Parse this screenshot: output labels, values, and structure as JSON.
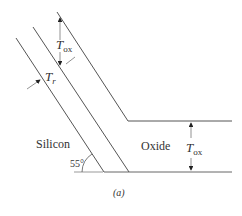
{
  "figure": {
    "caption": "(a)",
    "labels": {
      "silicon": "Silicon",
      "oxide": "Oxide",
      "angle": "55°",
      "tox_top_main": "T",
      "tox_top_sub": "ox",
      "tox_right_main": "T",
      "tox_right_sub": "ox",
      "tr_main": "T",
      "tr_sub": "r"
    },
    "angle_degrees": 55,
    "colors": {
      "line": "#555555",
      "arrow": "#222222",
      "text": "#333333",
      "baseline": "#999999"
    }
  }
}
